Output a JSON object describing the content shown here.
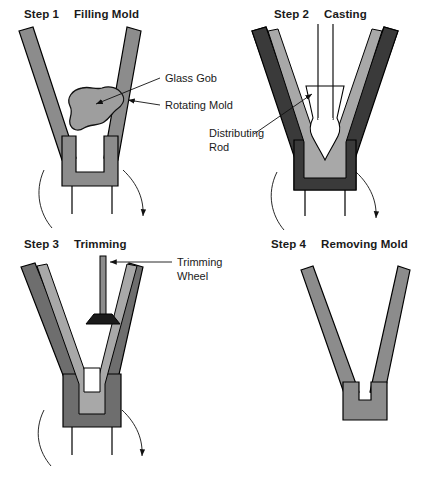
{
  "figure": {
    "panels": [
      {
        "id": "step-1",
        "step_label": "Step 1",
        "step_title": "Filling Mold",
        "callouts": [
          {
            "id": "glass-gob",
            "text": "Glass Gob"
          },
          {
            "id": "rotating-mold",
            "text": "Rotating Mold"
          }
        ]
      },
      {
        "id": "step-2",
        "step_label": "Step 2",
        "step_title": "Casting",
        "callouts": [
          {
            "id": "distributing-rod",
            "line1": "Distributing",
            "line2": "Rod"
          }
        ]
      },
      {
        "id": "step-3",
        "step_label": "Step 3",
        "step_title": "Trimming",
        "callouts": [
          {
            "id": "trimming-wheel",
            "line1": "Trimming",
            "line2": "Wheel"
          }
        ]
      },
      {
        "id": "step-4",
        "step_label": "Step 4",
        "step_title": "Removing Mold",
        "callouts": []
      }
    ]
  },
  "colors": {
    "background": "#ffffff",
    "outline": "#000000",
    "mold_gray": "#8c8c8c",
    "mold_dark": "#3a3a3a",
    "glass_light": "#a8a8a8",
    "gob_gray": "#9e9e9e",
    "cavity_white": "#ffffff",
    "text": "#1a1a1a"
  }
}
